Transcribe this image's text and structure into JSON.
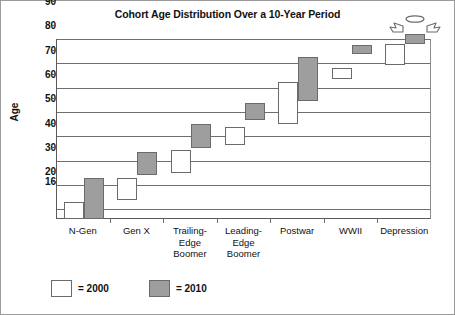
{
  "chart_data": {
    "type": "bar",
    "title": "Cohort Age Distribution Over a 10-Year Period",
    "xlabel": "",
    "ylabel": "Age",
    "ylim": [
      16,
      90
    ],
    "yticks": [
      16,
      20,
      30,
      40,
      50,
      60,
      70,
      80,
      90
    ],
    "grid": true,
    "legend_position": "bottom-left",
    "categories": [
      "N-Gen",
      "Trailing-Edge Boomer",
      "Gen X",
      "Leading-Edge Boomer",
      "Postwar",
      "WWII",
      "Depression"
    ],
    "category_lines": [
      [
        "N-Gen"
      ],
      [
        "Gen X"
      ],
      [
        "Trailing-",
        "Edge",
        "Boomer"
      ],
      [
        "Leading-",
        "Edge",
        "Boomer"
      ],
      [
        "Postwar"
      ],
      [
        "WWII"
      ],
      [
        "Depression"
      ]
    ],
    "series": [
      {
        "name": "2000",
        "color": "#ffffff",
        "ranges": [
          {
            "category": "N-Gen",
            "low": 16,
            "high": 23
          },
          {
            "category": "Gen X",
            "low": 24,
            "high": 33
          },
          {
            "category": "Trailing-Edge Boomer",
            "low": 35,
            "high": 44.5
          },
          {
            "category": "Leading-Edge Boomer",
            "low": 46.5,
            "high": 54
          },
          {
            "category": "Postwar",
            "low": 55,
            "high": 72.5
          },
          {
            "category": "WWII",
            "low": 73.5,
            "high": 78
          },
          {
            "category": "Depression",
            "low": 79.5,
            "high": 88
          }
        ]
      },
      {
        "name": "2010",
        "color": "#9e9e9e",
        "ranges": [
          {
            "category": "N-Gen",
            "low": 16,
            "high": 33
          },
          {
            "category": "Gen X",
            "low": 34,
            "high": 43.5
          },
          {
            "category": "Trailing-Edge Boomer",
            "low": 45,
            "high": 55
          },
          {
            "category": "Leading-Edge Boomer",
            "low": 56.5,
            "high": 63.5
          },
          {
            "category": "Postwar",
            "low": 64.5,
            "high": 82.5
          },
          {
            "category": "WWII",
            "low": 84,
            "high": 87.5
          },
          {
            "category": "Depression",
            "low": 88,
            "high": 92
          }
        ]
      }
    ],
    "annotations": [
      {
        "name": "angel-halo-wings",
        "description": "halo and wings above Depression 2010 box",
        "category": "Depression",
        "series": "2010"
      }
    ]
  },
  "legend": {
    "items": [
      {
        "label": "= 2000",
        "swatch": "white"
      },
      {
        "label": "= 2010",
        "swatch": "gray"
      }
    ]
  }
}
